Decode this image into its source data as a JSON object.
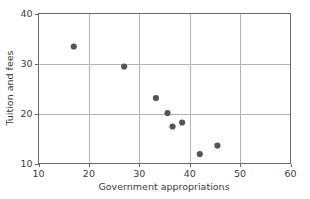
{
  "chart_data": {
    "type": "scatter",
    "title": "",
    "xlabel": "Government appropriations",
    "ylabel": "Tuition and fees",
    "xlim": [
      10,
      60
    ],
    "ylim": [
      10,
      40
    ],
    "xticks": [
      10,
      20,
      30,
      40,
      50,
      60
    ],
    "yticks": [
      10,
      20,
      30,
      40
    ],
    "xtick_labels": [
      "10",
      "20",
      "30",
      "40",
      "50",
      "60"
    ],
    "ytick_labels": [
      "10",
      "20",
      "30",
      "40"
    ],
    "grid": true,
    "legend": null,
    "marker": {
      "shape": "circle",
      "color": "#555555",
      "size": 3.1
    },
    "series": [
      {
        "name": "institutions",
        "points": [
          {
            "x": 17.0,
            "y": 33.4
          },
          {
            "x": 27.0,
            "y": 29.4
          },
          {
            "x": 33.3,
            "y": 23.1
          },
          {
            "x": 35.6,
            "y": 20.1
          },
          {
            "x": 36.6,
            "y": 17.4
          },
          {
            "x": 38.5,
            "y": 18.2
          },
          {
            "x": 42.0,
            "y": 11.9
          },
          {
            "x": 45.5,
            "y": 13.6
          }
        ]
      }
    ]
  },
  "style": {
    "frame_color": "#6a6a6a",
    "grid_color": "#b4b4b4",
    "text_color": "#3b3b3b",
    "background": "#ffffff"
  }
}
